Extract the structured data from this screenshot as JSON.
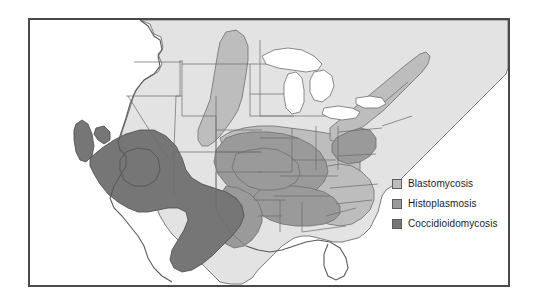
{
  "figure": {
    "type": "thematic-map",
    "title": "",
    "region": "United States"
  },
  "legend": {
    "items": [
      {
        "label": "Blastomycosis",
        "color": "#bdbdbd",
        "swatch_name": "legend-swatch-blastomycosis"
      },
      {
        "label": "Histoplasmosis",
        "color": "#9a9a9a",
        "swatch_name": "legend-swatch-histoplasmosis"
      },
      {
        "label": "Coccidioidomycosis",
        "color": "#767676",
        "swatch_name": "legend-swatch-coccidioidomycosis"
      }
    ]
  },
  "map": {
    "base_land_color": "#e3e3e3",
    "water_color": "#ffffff",
    "border_color": "#6e6e6e",
    "frame_color": "#4a4a4a",
    "background_color": "#ffffff",
    "disease_regions": [
      {
        "name": "Blastomycosis",
        "color": "#bdbdbd",
        "description": "Ohio and Mississippi River valleys, Great Lakes states, St. Lawrence River, mid-Atlantic and Southeast"
      },
      {
        "name": "Histoplasmosis",
        "color": "#9a9a9a",
        "description": "Ohio and Mississippi River valleys, central and southeastern United States"
      },
      {
        "name": "Coccidioidomycosis",
        "color": "#767676",
        "description": "Southwestern United States, central California, southern Arizona, New Mexico and west Texas"
      }
    ]
  }
}
